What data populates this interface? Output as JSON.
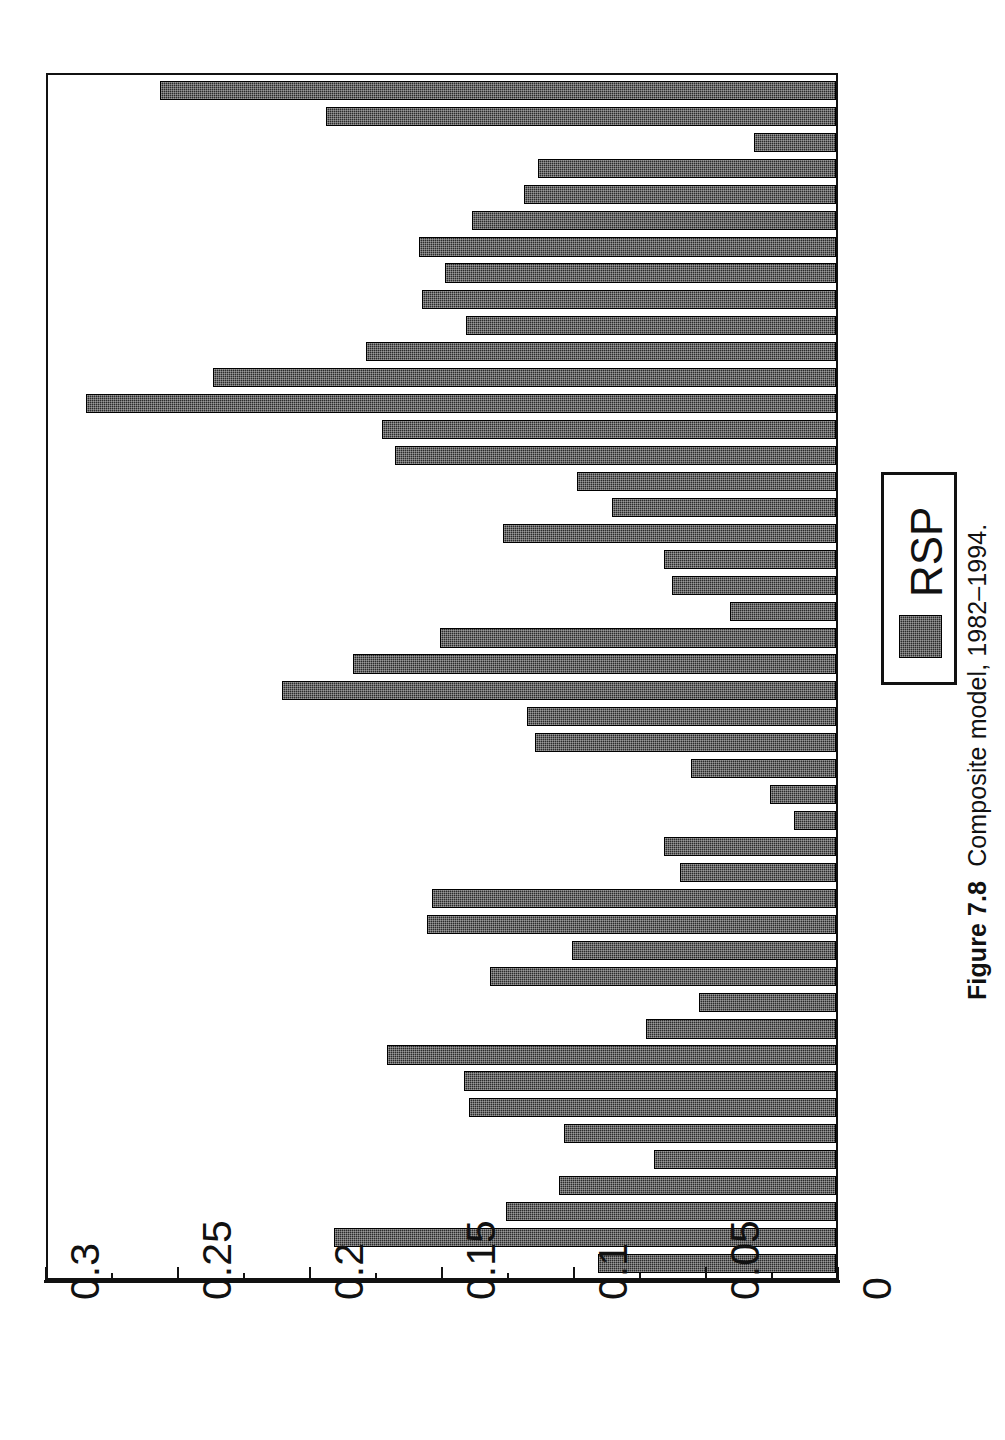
{
  "caption": {
    "label": "Figure 7.8",
    "text": "Composite model, 1982–1994."
  },
  "legend": {
    "entries": [
      {
        "name": "RSP",
        "swatch_color": "#2b2b2b",
        "swatch_pattern": "checkered"
      }
    ]
  },
  "axis": {
    "orientation": "horizontal-value-axis-reversed",
    "tick_labels": [
      "0.3",
      "0.25",
      "0.2",
      "0.15",
      "0.1",
      "0.05",
      "0"
    ],
    "tick_values": [
      0.3,
      0.25,
      0.2,
      0.15,
      0.1,
      0.05,
      0
    ],
    "minor_ticks_per_interval": 1,
    "range_min": 0,
    "range_max": 0.3
  },
  "colors": {
    "bar_fill": "#2b2b2b",
    "bar_border": "#000000",
    "frame": "#111111",
    "background": "#ffffff",
    "text": "#111111"
  },
  "chart_data": {
    "type": "bar",
    "orientation": "horizontal",
    "title": "Composite model, 1982–1994.",
    "xlabel": "",
    "ylabel": "",
    "xlim": [
      0,
      0.3
    ],
    "grid": false,
    "legend_position": "right",
    "series": [
      {
        "name": "RSP",
        "values": [
          0.256,
          0.193,
          0.031,
          0.113,
          0.118,
          0.138,
          0.158,
          0.148,
          0.157,
          0.14,
          0.178,
          0.236,
          0.284,
          0.172,
          0.167,
          0.098,
          0.085,
          0.126,
          0.065,
          0.062,
          0.04,
          0.15,
          0.183,
          0.21,
          0.117,
          0.114,
          0.055,
          0.025,
          0.016,
          0.065,
          0.059,
          0.153,
          0.155,
          0.1,
          0.131,
          0.052,
          0.072,
          0.17,
          0.141,
          0.139,
          0.103,
          0.069,
          0.105,
          0.125,
          0.19,
          0.09
        ]
      }
    ]
  }
}
